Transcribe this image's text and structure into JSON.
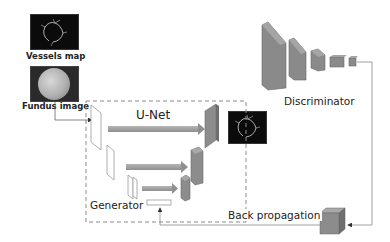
{
  "inputs": {
    "vessels_map": {
      "label": "Vessels map"
    },
    "fundus_image": {
      "label": "Fundus image"
    }
  },
  "generator": {
    "title": "U-Net",
    "label": "Generator"
  },
  "output": {
    "label": ""
  },
  "discriminator": {
    "label": "Discriminator"
  },
  "feedback": {
    "label": "Back propagation"
  },
  "colors": {
    "dashed_box": "#8a8a8a",
    "encoder_fill": "#ffffff",
    "decoder_fill": "#8c8c8c",
    "skip_arrow": "#a0a0a0",
    "disc_fill": "#8a8a8a",
    "line": "#888888"
  }
}
